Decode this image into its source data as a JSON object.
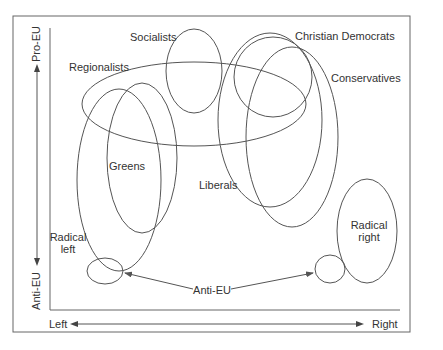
{
  "diagram": {
    "axes": {
      "y_top_label": "Pro-EU",
      "y_bottom_label": "Anti-EU",
      "x_left_label": "Left",
      "x_right_label": "Right"
    },
    "groups": [
      {
        "id": "socialists",
        "label": "Socialists"
      },
      {
        "id": "regionalists",
        "label": "Regionalists"
      },
      {
        "id": "christian-democrats",
        "label": "Christian Democrats"
      },
      {
        "id": "conservatives",
        "label": "Conservatives"
      },
      {
        "id": "greens",
        "label": "Greens"
      },
      {
        "id": "liberals",
        "label": "Liberals"
      },
      {
        "id": "radical-left",
        "label_line1": "Radical",
        "label_line2": "left"
      },
      {
        "id": "radical-right",
        "label_line1": "Radical",
        "label_line2": "right"
      },
      {
        "id": "anti-eu",
        "label": "Anti-EU"
      }
    ],
    "colors": {
      "line": "#555555",
      "text": "#333333",
      "background": "#ffffff"
    }
  }
}
